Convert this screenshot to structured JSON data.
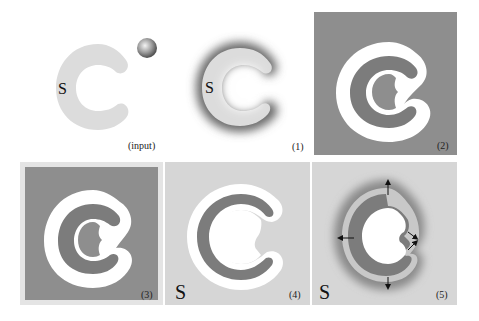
{
  "figure": {
    "panels": [
      {
        "id": "input",
        "caption": "(input)",
        "s_marker": "S",
        "has_ball": true
      },
      {
        "id": "1",
        "caption": "(1)",
        "s_marker": "S"
      },
      {
        "id": "2",
        "caption": "(2)"
      },
      {
        "id": "3",
        "caption": "(3)"
      },
      {
        "id": "4",
        "caption": "(4)",
        "s_marker": "S"
      },
      {
        "id": "5",
        "caption": "(5)",
        "s_marker": "S",
        "arrows": 5
      }
    ],
    "colors": {
      "c_shape_light": "#dcdcdc",
      "panel_dark": "#8e8e8e",
      "panel_light": "#d6d6d6",
      "c_shape_dark": "#7c7c7c",
      "offset_band": "#ffffff",
      "border_light": "#e4e4e4"
    }
  }
}
